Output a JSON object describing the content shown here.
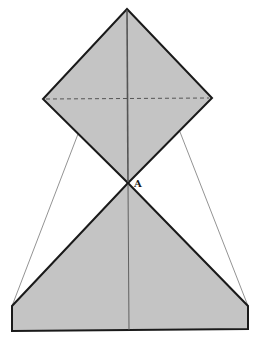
{
  "diagram": {
    "type": "origami-fold-step",
    "colors": {
      "paper_fill": "#c4c4c4",
      "outline": "#1a1a1a",
      "crease": "#555555",
      "guide_line": "#777777",
      "background": "#ffffff"
    },
    "labels": {
      "point_a": "A"
    },
    "shapes": {
      "top_diamond": {
        "top": [
          127,
          9
        ],
        "left": [
          43,
          99
        ],
        "right": [
          212,
          98
        ],
        "bottom": [
          128,
          183
        ]
      },
      "bottom_flap": {
        "apex": [
          128,
          183
        ],
        "left_corner": [
          12,
          306
        ],
        "right_corner": [
          248,
          306
        ],
        "bottom_left": [
          12,
          331
        ],
        "bottom_right": [
          248,
          329
        ]
      },
      "dashed_fold_line": {
        "from": [
          46,
          99
        ],
        "to": [
          209,
          98
        ]
      },
      "center_crease": {
        "from": [
          127,
          9
        ],
        "to": [
          129,
          330
        ]
      },
      "guide_lines": [
        {
          "from": [
            78,
            134
          ],
          "to": [
            12,
            306
          ]
        },
        {
          "from": [
            180,
            132
          ],
          "to": [
            248,
            306
          ]
        }
      ]
    }
  }
}
